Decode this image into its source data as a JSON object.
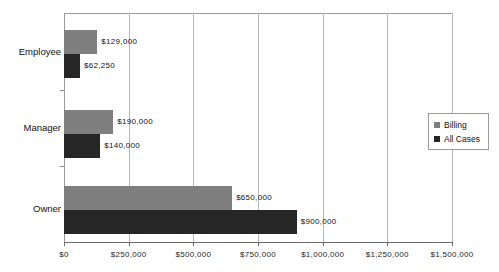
{
  "chart_data": {
    "type": "bar",
    "orientation": "horizontal",
    "title": "",
    "xlabel": "",
    "ylabel": "",
    "categories": [
      "Employee",
      "Manager",
      "Owner"
    ],
    "series": [
      {
        "name": "Billing",
        "color": "#7f7f7f",
        "values": [
          129000,
          190000,
          650000
        ],
        "labels": [
          "$129,000",
          "$190,000",
          "$650,000"
        ]
      },
      {
        "name": "All Cases",
        "color": "#262626",
        "values": [
          62250,
          140000,
          900000
        ],
        "labels": [
          "$62,250",
          "$140,000",
          "$900,000"
        ]
      }
    ],
    "xlim": [
      0,
      1500000
    ],
    "xticks": [
      0,
      250000,
      500000,
      750000,
      1000000,
      1250000,
      1500000
    ],
    "xticklabels": [
      "$0",
      "$250,000",
      "$500,000",
      "$750,000",
      "$1,000,000",
      "$1,250,000",
      "$1,500,000"
    ],
    "grid": "vertical",
    "legend_position": "right-middle",
    "legend_entries": [
      "Billing",
      "All Cases"
    ]
  },
  "axis": {
    "x_tick_labels": [
      "$0",
      "$250,000",
      "$500,000",
      "$750,000",
      "$1,000,000",
      "$1,250,000",
      "$1,500,000"
    ],
    "category_labels": [
      "Employee",
      "Manager",
      "Owner"
    ]
  },
  "legend": {
    "entries": [
      {
        "label": "Billing",
        "color": "#7f7f7f"
      },
      {
        "label": "All Cases",
        "color": "#262626"
      }
    ]
  },
  "bars": [
    {
      "category": "Employee",
      "series": "Billing",
      "value_label": "$129,000"
    },
    {
      "category": "Employee",
      "series": "All Cases",
      "value_label": "$62,250"
    },
    {
      "category": "Manager",
      "series": "Billing",
      "value_label": "$190,000"
    },
    {
      "category": "Manager",
      "series": "All Cases",
      "value_label": "$140,000"
    },
    {
      "category": "Owner",
      "series": "Billing",
      "value_label": "$650,000"
    },
    {
      "category": "Owner",
      "series": "All Cases",
      "value_label": "$900,000"
    }
  ]
}
